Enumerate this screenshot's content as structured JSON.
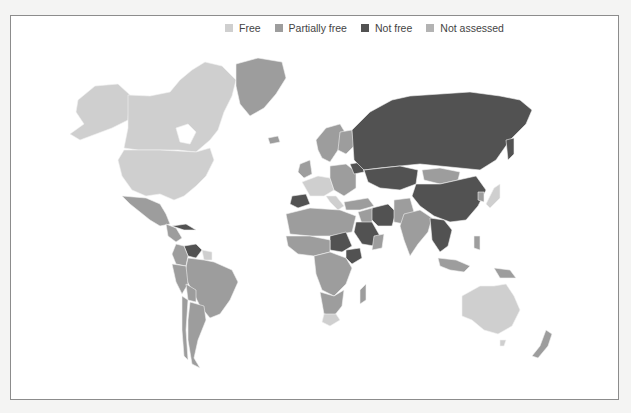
{
  "legend": {
    "items": [
      {
        "label": "Free",
        "color": "#cfcfcf",
        "key": "free"
      },
      {
        "label": "Partially free",
        "color": "#9d9d9d",
        "key": "partly"
      },
      {
        "label": "Not free",
        "color": "#525252",
        "key": "notfree"
      },
      {
        "label": "Not assessed",
        "color": "#b3b3b3",
        "key": "na"
      }
    ]
  },
  "map": {
    "title": "World freedom status map",
    "regions": [
      {
        "name": "Alaska / USA",
        "status": "free"
      },
      {
        "name": "Canada",
        "status": "free"
      },
      {
        "name": "United States",
        "status": "free"
      },
      {
        "name": "Greenland",
        "status": "partly"
      },
      {
        "name": "Iceland",
        "status": "partly"
      },
      {
        "name": "Mexico",
        "status": "partly"
      },
      {
        "name": "Central America",
        "status": "partly"
      },
      {
        "name": "Cuba",
        "status": "notfree"
      },
      {
        "name": "Venezuela",
        "status": "notfree"
      },
      {
        "name": "Colombia",
        "status": "partly"
      },
      {
        "name": "Brazil",
        "status": "partly"
      },
      {
        "name": "Peru",
        "status": "partly"
      },
      {
        "name": "Bolivia",
        "status": "partly"
      },
      {
        "name": "Argentina",
        "status": "partly"
      },
      {
        "name": "Chile",
        "status": "partly"
      },
      {
        "name": "Guyana / Suriname",
        "status": "free"
      },
      {
        "name": "Scandinavia",
        "status": "partly"
      },
      {
        "name": "UK / Ireland",
        "status": "partly"
      },
      {
        "name": "Western Europe",
        "status": "free"
      },
      {
        "name": "Spain",
        "status": "notfree"
      },
      {
        "name": "Central Europe",
        "status": "partly"
      },
      {
        "name": "Belarus",
        "status": "notfree"
      },
      {
        "name": "Russia",
        "status": "notfree"
      },
      {
        "name": "Kazakhstan",
        "status": "notfree"
      },
      {
        "name": "Mongolia",
        "status": "partly"
      },
      {
        "name": "China",
        "status": "notfree"
      },
      {
        "name": "Japan",
        "status": "free"
      },
      {
        "name": "Korea",
        "status": "partly"
      },
      {
        "name": "Turkey",
        "status": "partly"
      },
      {
        "name": "Iran",
        "status": "notfree"
      },
      {
        "name": "Saudi Arabia",
        "status": "notfree"
      },
      {
        "name": "Iraq / Syria",
        "status": "partly"
      },
      {
        "name": "Pakistan / Afghanistan",
        "status": "partly"
      },
      {
        "name": "India",
        "status": "partly"
      },
      {
        "name": "Southeast Asia",
        "status": "notfree"
      },
      {
        "name": "Indonesia",
        "status": "partly"
      },
      {
        "name": "Papua New Guinea",
        "status": "partly"
      },
      {
        "name": "North Africa",
        "status": "partly"
      },
      {
        "name": "Sudan",
        "status": "notfree"
      },
      {
        "name": "Ethiopia",
        "status": "notfree"
      },
      {
        "name": "Central Africa",
        "status": "partly"
      },
      {
        "name": "Southern Africa",
        "status": "partly"
      },
      {
        "name": "South Africa",
        "status": "free"
      },
      {
        "name": "Madagascar",
        "status": "partly"
      },
      {
        "name": "Australia",
        "status": "free"
      },
      {
        "name": "New Zealand",
        "status": "partly"
      }
    ]
  }
}
